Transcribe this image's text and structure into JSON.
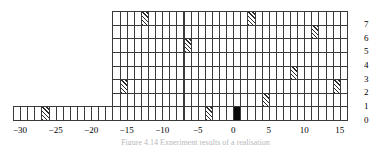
{
  "figure": {
    "caption": "Figure 4.14   Experiment results of a realisation"
  },
  "chart_data": {
    "type": "bar",
    "title": "",
    "xlabel": "",
    "ylabel": "",
    "grid": true,
    "legend_position": "none",
    "xlim": [
      -31,
      16
    ],
    "ylim": [
      0,
      7
    ],
    "xticks": [
      -30,
      -25,
      -20,
      -15,
      -10,
      -5,
      0,
      5,
      10,
      15
    ],
    "xtick_labels": [
      "−30",
      "−25",
      "−20",
      "−15",
      "−10",
      "−5",
      "0",
      "5",
      "10",
      "15"
    ],
    "yticks": [
      0,
      1,
      2,
      3,
      4,
      5,
      6,
      7
    ],
    "ytick_labels": [
      "0",
      "1",
      "2",
      "3",
      "4",
      "5",
      "6",
      "7"
    ],
    "note": "Stacked unit-square histogram. Each column of width 1 is drawn as a stack of unit cells. Most cells are empty (white); marked cells are hatched; one cell is solid black.",
    "categories": [
      -31,
      -30,
      -29,
      -28,
      -27,
      -26,
      -25,
      -24,
      -23,
      -22,
      -21,
      -20,
      -19,
      -18,
      -17,
      -16,
      -15,
      -14,
      -13,
      -12,
      -11,
      -10,
      -9,
      -8,
      -7,
      -6,
      -5,
      -4,
      -3,
      -2,
      -1,
      0,
      1,
      2,
      3,
      4,
      5,
      6,
      7,
      8,
      9,
      10,
      11,
      12,
      13,
      14,
      15
    ],
    "values": [
      1,
      1,
      1,
      1,
      1,
      1,
      1,
      1,
      1,
      1,
      1,
      1,
      1,
      1,
      8,
      8,
      8,
      8,
      8,
      8,
      8,
      8,
      8,
      8,
      8,
      8,
      8,
      8,
      8,
      8,
      8,
      8,
      8,
      8,
      8,
      8,
      8,
      8,
      8,
      8,
      8,
      8,
      8,
      8,
      8,
      8,
      8
    ],
    "marked_cells": [
      {
        "x": -27,
        "y": 0,
        "fill": "hatch"
      },
      {
        "x": -16,
        "y": 2,
        "fill": "hatch"
      },
      {
        "x": -13,
        "y": 7,
        "fill": "hatch"
      },
      {
        "x": -7,
        "y": 5,
        "fill": "hatch"
      },
      {
        "x": -4,
        "y": 0,
        "fill": "hatch"
      },
      {
        "x": 0,
        "y": 0,
        "fill": "solid"
      },
      {
        "x": 2,
        "y": 7,
        "fill": "hatch"
      },
      {
        "x": 4,
        "y": 1,
        "fill": "hatch"
      },
      {
        "x": 8,
        "y": 3,
        "fill": "hatch"
      },
      {
        "x": 11,
        "y": 6,
        "fill": "hatch"
      },
      {
        "x": 14,
        "y": 2,
        "fill": "hatch"
      }
    ],
    "colors": {
      "grid_line": "#3a3a3a",
      "cell_empty": "#ffffff",
      "cell_hatch": "#2b2b2b",
      "cell_solid": "#0b0b0b",
      "text": "#000000"
    }
  }
}
